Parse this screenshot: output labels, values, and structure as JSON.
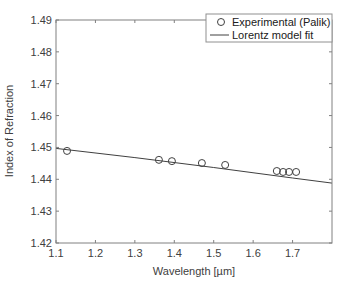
{
  "chart_data": {
    "type": "scatter",
    "title": "",
    "xlabel": "Wavelength [µm]",
    "ylabel": "Index of Refraction",
    "xlim": [
      1.1,
      1.8
    ],
    "ylim": [
      1.42,
      1.49
    ],
    "xticks": [
      1.1,
      1.2,
      1.3,
      1.4,
      1.5,
      1.6,
      1.7
    ],
    "xtick_labels": [
      "1.1",
      "1.2",
      "1.3",
      "1.4",
      "1.5",
      "1.6",
      "1.7"
    ],
    "yticks": [
      1.42,
      1.43,
      1.44,
      1.45,
      1.46,
      1.47,
      1.48,
      1.49
    ],
    "ytick_labels": [
      "1.42",
      "1.43",
      "1.44",
      "1.45",
      "1.46",
      "1.47",
      "1.48",
      "1.49"
    ],
    "grid": false,
    "legend_position": "upper right",
    "series": [
      {
        "name": "Experimental (Palik)",
        "style": "markers-open-circle",
        "x": [
          1.128,
          1.361,
          1.394,
          1.47,
          1.529,
          1.66,
          1.676,
          1.691,
          1.709
        ],
        "y": [
          1.4489,
          1.4461,
          1.4457,
          1.4451,
          1.4445,
          1.4426,
          1.4423,
          1.4423,
          1.4423
        ]
      },
      {
        "name": "Lorentz model fit",
        "style": "line",
        "x": [
          1.1,
          1.3,
          1.5,
          1.7,
          1.8
        ],
        "y": [
          1.4497,
          1.4468,
          1.4437,
          1.4404,
          1.4388
        ]
      }
    ]
  },
  "plot": {
    "left": 56,
    "top": 20,
    "right": 332,
    "bottom": 243,
    "line_color": "#404040",
    "axis_color": "#808080"
  },
  "legend": {
    "items": [
      {
        "label": "Experimental (Palik)",
        "symbol": "circle"
      },
      {
        "label": "Lorentz model fit",
        "symbol": "line"
      }
    ]
  }
}
